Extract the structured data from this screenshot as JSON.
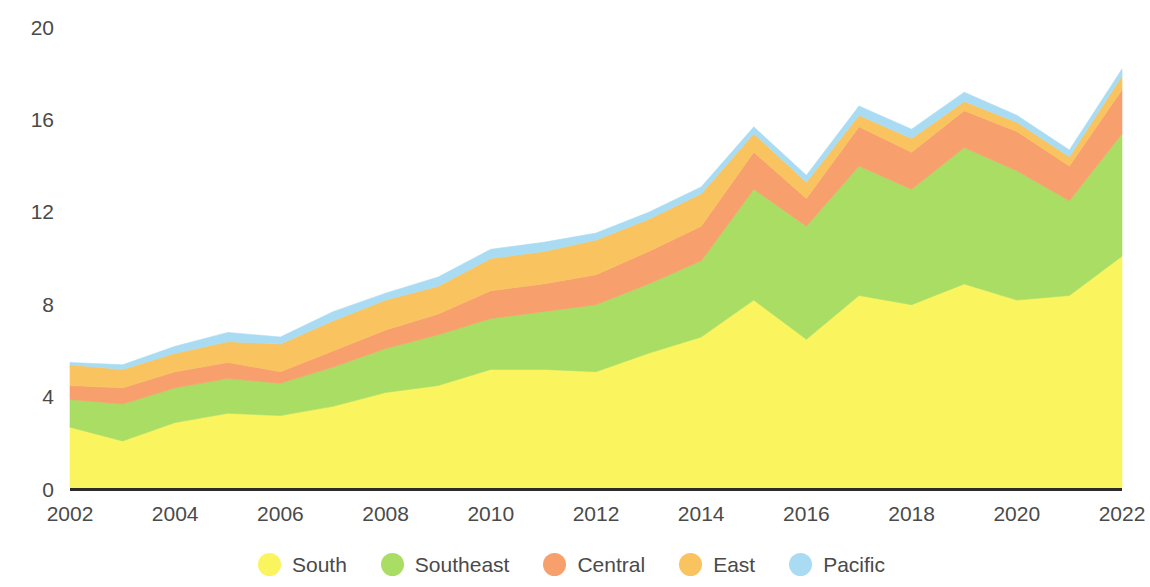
{
  "chart_data": {
    "type": "area",
    "stacked": true,
    "title": "",
    "subtitle": "",
    "xlabel": "",
    "ylabel": "",
    "grid": false,
    "legend_position": "bottom",
    "xlim": [
      2002,
      2022
    ],
    "ylim": [
      0,
      20
    ],
    "x": [
      2002,
      2003,
      2004,
      2005,
      2006,
      2007,
      2008,
      2009,
      2010,
      2011,
      2012,
      2013,
      2014,
      2015,
      2016,
      2017,
      2018,
      2019,
      2020,
      2021,
      2022
    ],
    "xticks": [
      2002,
      2004,
      2006,
      2008,
      2010,
      2012,
      2014,
      2016,
      2018,
      2020,
      2022
    ],
    "xtick_labels": [
      "2002",
      "2004",
      "2006",
      "2008",
      "2010",
      "2012",
      "2014",
      "2016",
      "2018",
      "2020",
      "2022"
    ],
    "yticks": [
      0,
      4,
      8,
      12,
      16,
      20
    ],
    "ytick_labels": [
      "0",
      "4",
      "8",
      "12",
      "16",
      "20"
    ],
    "series": [
      {
        "name": "South",
        "color": "#faf45f",
        "values": [
          2.7,
          2.1,
          2.9,
          3.3,
          3.2,
          3.6,
          4.2,
          4.5,
          5.2,
          5.2,
          5.1,
          5.9,
          6.6,
          8.2,
          6.5,
          8.4,
          8.0,
          8.9,
          8.2,
          8.4,
          10.1
        ]
      },
      {
        "name": "Southeast",
        "color": "#aadd63",
        "values": [
          1.2,
          1.6,
          1.5,
          1.5,
          1.4,
          1.7,
          1.9,
          2.2,
          2.2,
          2.5,
          2.9,
          3.0,
          3.3,
          4.8,
          4.9,
          5.6,
          5.0,
          5.9,
          5.6,
          4.1,
          5.3
        ]
      },
      {
        "name": "Central",
        "color": "#f79f6d",
        "values": [
          0.6,
          0.7,
          0.7,
          0.7,
          0.5,
          0.7,
          0.8,
          0.9,
          1.2,
          1.2,
          1.3,
          1.4,
          1.5,
          1.6,
          1.2,
          1.7,
          1.6,
          1.6,
          1.7,
          1.5,
          1.9
        ]
      },
      {
        "name": "East",
        "color": "#f9c45f",
        "values": [
          0.9,
          0.8,
          0.8,
          0.9,
          1.2,
          1.3,
          1.3,
          1.2,
          1.4,
          1.4,
          1.5,
          1.4,
          1.4,
          0.8,
          0.7,
          0.5,
          0.6,
          0.4,
          0.4,
          0.4,
          0.6
        ]
      },
      {
        "name": "Pacific",
        "color": "#a9dcf2",
        "values": [
          0.1,
          0.2,
          0.3,
          0.4,
          0.3,
          0.4,
          0.3,
          0.4,
          0.4,
          0.4,
          0.3,
          0.3,
          0.3,
          0.3,
          0.3,
          0.4,
          0.4,
          0.4,
          0.3,
          0.3,
          0.3
        ]
      }
    ]
  },
  "axis": {
    "baseline_color": "#2b2b2b",
    "tick_text_color": "#4a4a4a"
  },
  "legend": {
    "items": [
      {
        "label": "South",
        "color": "#faf45f",
        "swatch": "circle-swatch"
      },
      {
        "label": "Southeast",
        "color": "#aadd63",
        "swatch": "circle-swatch"
      },
      {
        "label": "Central",
        "color": "#f79f6d",
        "swatch": "circle-swatch"
      },
      {
        "label": "East",
        "color": "#f9c45f",
        "swatch": "circle-swatch"
      },
      {
        "label": "Pacific",
        "color": "#a9dcf2",
        "swatch": "circle-swatch"
      }
    ]
  }
}
